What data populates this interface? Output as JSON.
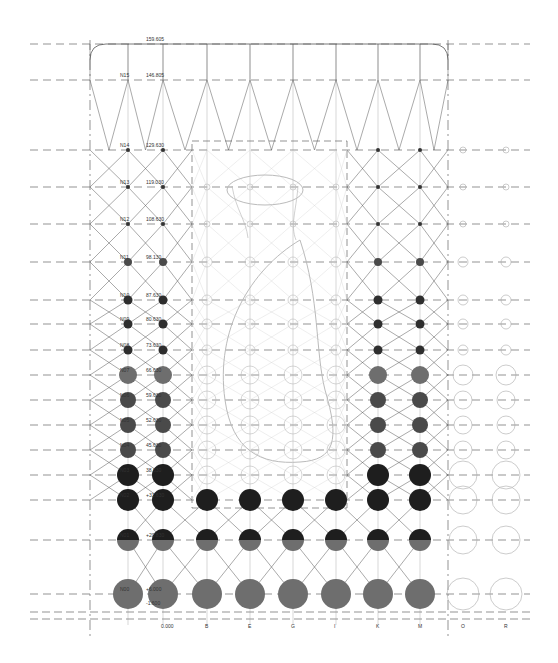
{
  "drawing": {
    "type": "architectural-section-grid",
    "level_labels": [
      {
        "id": "top",
        "name": "",
        "elevation": "159.605",
        "y": 44
      },
      {
        "id": "N15",
        "name": "N15",
        "elevation": "146.805",
        "y": 80
      },
      {
        "id": "N14",
        "name": "N14",
        "elevation": "129.630",
        "y": 150
      },
      {
        "id": "N13",
        "name": "N13",
        "elevation": "119.030",
        "y": 187
      },
      {
        "id": "N12",
        "name": "N12",
        "elevation": "108.630",
        "y": 224
      },
      {
        "id": "N11",
        "name": "N11",
        "elevation": "98.130",
        "y": 262
      },
      {
        "id": "N10",
        "name": "N10",
        "elevation": "87.630",
        "y": 300
      },
      {
        "id": "N09",
        "name": "N09",
        "elevation": "80.630",
        "y": 324
      },
      {
        "id": "N08",
        "name": "N08",
        "elevation": "73.630",
        "y": 350
      },
      {
        "id": "N07",
        "name": "N07",
        "elevation": "66.630",
        "y": 375
      },
      {
        "id": "N06",
        "name": "N06",
        "elevation": "59.630",
        "y": 400
      },
      {
        "id": "N05",
        "name": "N05",
        "elevation": "52.630",
        "y": 425
      },
      {
        "id": "N04",
        "name": "N04",
        "elevation": "45.630",
        "y": 450
      },
      {
        "id": "N03",
        "name": "N03",
        "elevation": "38.630",
        "y": 475
      },
      {
        "id": "N02",
        "name": "N02",
        "elevation": "+31.630",
        "y": 500
      },
      {
        "id": "N01",
        "name": "N01",
        "elevation": "+20.830",
        "y": 540
      },
      {
        "id": "N00",
        "name": "N00",
        "elevation": "+6.000",
        "y": 594
      }
    ],
    "base_elevations": [
      "-1.600",
      "0.000"
    ],
    "column_axes": [
      {
        "label": "",
        "x": 128
      },
      {
        "label": "0.000",
        "x": 163
      },
      {
        "label": "B",
        "x": 207
      },
      {
        "label": "E",
        "x": 250
      },
      {
        "label": "G",
        "x": 293
      },
      {
        "label": "I",
        "x": 336
      },
      {
        "label": "K",
        "x": 378
      },
      {
        "label": "M",
        "x": 420
      },
      {
        "label": "O",
        "x": 463
      },
      {
        "label": "R",
        "x": 506
      }
    ],
    "colors": {
      "line": "#555555",
      "dashed": "#666666",
      "node_dark": "#1e1e1e",
      "node_mid": "#4a4a4a",
      "node_grey": "#6e6e6e",
      "void_outline": "#bbbbbb",
      "light_lines": "#cfcfcf"
    }
  }
}
